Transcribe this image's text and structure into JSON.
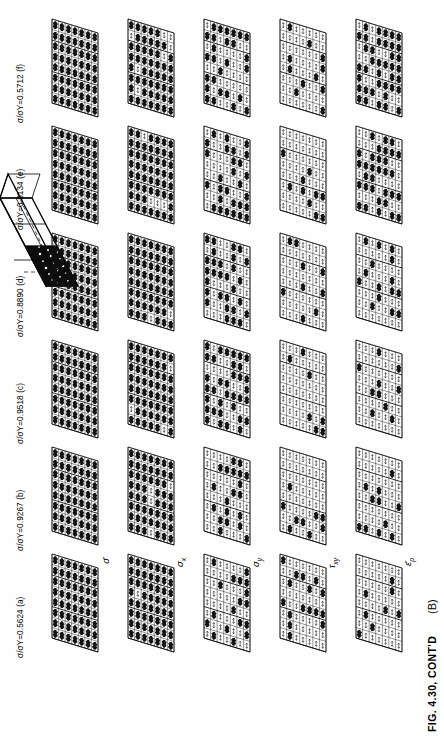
{
  "figure": {
    "caption": "FIG. 4.30, CONT'D",
    "panel_letter": "(B)",
    "accent_color": "#000000",
    "background_color": "#ffffff"
  },
  "load_cases": [
    {
      "id": "a",
      "label": "σ/σY=0.5624 (a)",
      "ratio": 0.5624,
      "letter": "(a)"
    },
    {
      "id": "b",
      "label": "σ/σY=0.9267 (b)",
      "ratio": 0.9267,
      "letter": "(b)"
    },
    {
      "id": "c",
      "label": "σ/σY=0.9518 (c)",
      "ratio": 0.9518,
      "letter": "(c)"
    },
    {
      "id": "d",
      "label": "σ/σY=0.8890 (d)",
      "ratio": 0.889,
      "letter": "(d)"
    },
    {
      "id": "e",
      "label": "σ/σY=0.8134 (e)",
      "ratio": 0.8134,
      "letter": "(e)"
    },
    {
      "id": "f",
      "label": "σ/σY=0.5712 (f)",
      "ratio": 0.5712,
      "letter": "(f)"
    }
  ],
  "quantities": [
    {
      "id": "sigma-eff",
      "label": "σ̄",
      "sub": ""
    },
    {
      "id": "sigma-x",
      "label": "σ",
      "sub": "x"
    },
    {
      "id": "sigma-y",
      "label": "σ",
      "sub": "y"
    },
    {
      "id": "tau-xy",
      "label": "τ",
      "sub": "xy"
    },
    {
      "id": "eps-p",
      "label": "ε̄",
      "sub": "p"
    }
  ],
  "chart_data": {
    "type": "heatmap",
    "title": "FIG. 4.30, CONT'D  (B)",
    "rows": [
      "σ̄",
      "σx",
      "σy",
      "τxy",
      "ε̄p"
    ],
    "columns": [
      "(a)",
      "(b)",
      "(c)",
      "(d)",
      "(e)",
      "(f)"
    ],
    "column_values": [
      0.5624,
      0.9267,
      0.9518,
      0.889,
      0.8134,
      0.5712
    ],
    "xlabel": "σ/σY",
    "ylabel": "stress / strain component",
    "legend": "none",
    "grid": true,
    "mesh": {
      "cells_x": 8,
      "cells_y": 7,
      "shear_skew_deg": 20
    },
    "intensity": [
      {
        "row": "σ̄",
        "values": [
          1.0,
          1.0,
          1.0,
          1.0,
          1.0,
          1.0
        ]
      },
      {
        "row": "σx",
        "values": [
          0.92,
          0.95,
          0.95,
          0.95,
          0.95,
          0.88
        ]
      },
      {
        "row": "σy",
        "values": [
          0.3,
          0.32,
          0.55,
          0.58,
          0.58,
          0.5
        ]
      },
      {
        "row": "τxy",
        "values": [
          0.22,
          0.22,
          0.25,
          0.27,
          0.27,
          0.24
        ]
      },
      {
        "row": "ε̄p",
        "values": [
          0.2,
          0.2,
          0.22,
          0.24,
          0.58,
          0.62
        ]
      }
    ]
  },
  "inset": {
    "name": "plate-shear-band-sketch",
    "description": "Isometric sketch of the plate showing the localized plastic (dark) zone and through-thickness shear lines."
  }
}
